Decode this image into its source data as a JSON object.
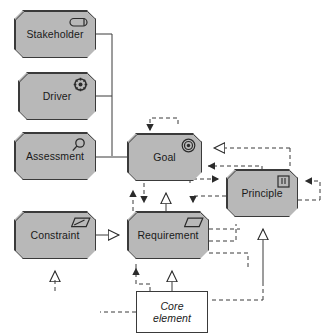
{
  "diagram": {
    "background_color": "#ffffff",
    "element_fill": "#b8b8b8",
    "element_stroke": "#3a3a3a",
    "core_fill": "#ffffff",
    "line_color": "#3a3a3a"
  },
  "nodes": [
    {
      "id": "stakeholder",
      "label": "Stakeholder",
      "icon": "role-icon",
      "shape": "octagon",
      "x": 14,
      "y": 10,
      "w": 82,
      "h": 48
    },
    {
      "id": "driver",
      "label": "Driver",
      "icon": "steering-wheel-icon",
      "shape": "octagon",
      "x": 18,
      "y": 72,
      "w": 78,
      "h": 48
    },
    {
      "id": "assessment",
      "label": "Assessment",
      "icon": "magnifier-icon",
      "shape": "octagon",
      "x": 14,
      "y": 132,
      "w": 82,
      "h": 48
    },
    {
      "id": "goal",
      "label": "Goal",
      "icon": "target-icon",
      "shape": "octagon",
      "x": 127,
      "y": 133,
      "w": 75,
      "h": 48
    },
    {
      "id": "principle",
      "label": "Principle",
      "icon": "principle-icon",
      "shape": "octagon",
      "x": 226,
      "y": 169,
      "w": 72,
      "h": 48
    },
    {
      "id": "constraint",
      "label": "Constraint",
      "icon": "constraint-icon",
      "shape": "octagon",
      "x": 14,
      "y": 211,
      "w": 82,
      "h": 48
    },
    {
      "id": "requirement",
      "label": "Requirement",
      "icon": "requirement-icon",
      "shape": "octagon",
      "x": 127,
      "y": 211,
      "w": 82,
      "h": 48
    },
    {
      "id": "core-element",
      "label": "Core\nelement",
      "icon": "none",
      "shape": "rectangle",
      "x": 136,
      "y": 291,
      "w": 72,
      "h": 42
    }
  ],
  "icons": {
    "role-icon": "stakeholder role (pill with bar)",
    "steering-wheel-icon": "driver steering wheel",
    "magnifier-icon": "assessment magnifying glass",
    "target-icon": "goal concentric circles",
    "principle-icon": "principle rectangle with exclamation marks",
    "constraint-icon": "constraint parallelogram with slash",
    "requirement-icon": "requirement parallelogram"
  },
  "relations": [
    {
      "from": "stakeholder",
      "to": "goal",
      "type": "association",
      "style": "solid",
      "arrow": "none"
    },
    {
      "from": "driver",
      "to": "goal",
      "type": "association",
      "style": "solid",
      "arrow": "none"
    },
    {
      "from": "assessment",
      "to": "goal",
      "type": "association",
      "style": "solid",
      "arrow": "none"
    },
    {
      "from": "goal",
      "to": "goal",
      "type": "influence",
      "style": "dashed",
      "arrow": "filled-triangle"
    },
    {
      "from": "principle",
      "to": "goal",
      "type": "realization",
      "style": "dashed",
      "arrow": "hollow-triangle"
    },
    {
      "from": "principle",
      "to": "goal",
      "type": "influence",
      "style": "dashed",
      "arrow": "filled-triangle"
    },
    {
      "from": "goal",
      "to": "principle",
      "type": "influence",
      "style": "dashed",
      "arrow": "filled-triangle"
    },
    {
      "from": "principle",
      "to": "principle",
      "type": "influence",
      "style": "dashed",
      "arrow": "filled-triangle"
    },
    {
      "from": "requirement",
      "to": "goal",
      "type": "influence",
      "style": "dashed",
      "arrow": "filled-triangle"
    },
    {
      "from": "requirement",
      "to": "goal",
      "type": "realization",
      "style": "solid",
      "arrow": "hollow-triangle"
    },
    {
      "from": "goal",
      "to": "requirement",
      "type": "influence",
      "style": "dashed",
      "arrow": "filled-triangle"
    },
    {
      "from": "principle",
      "to": "requirement",
      "type": "influence",
      "style": "dashed",
      "arrow": "filled-triangle"
    },
    {
      "from": "constraint",
      "to": "requirement",
      "type": "specialization",
      "style": "solid",
      "arrow": "hollow-triangle"
    },
    {
      "from": "constraint",
      "to": "constraint",
      "type": "realization",
      "style": "dashed",
      "arrow": "hollow-triangle"
    },
    {
      "from": "core-element",
      "to": "requirement",
      "type": "influence",
      "style": "dashed",
      "arrow": "filled-triangle"
    },
    {
      "from": "core-element",
      "to": "requirement",
      "type": "realization",
      "style": "solid",
      "arrow": "hollow-triangle"
    },
    {
      "from": "core-element",
      "to": "principle",
      "type": "realization",
      "style": "dashed",
      "arrow": "hollow-triangle"
    },
    {
      "from": "requirement",
      "to": "principle",
      "type": "influence",
      "style": "dashed",
      "arrow": "filled-triangle"
    }
  ]
}
